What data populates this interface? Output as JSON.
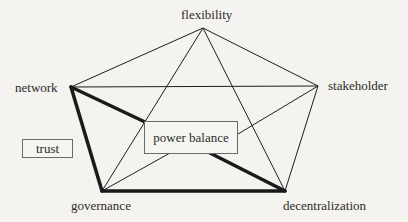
{
  "diagram": {
    "type": "pentagon-star-network",
    "nodes": [
      {
        "id": "flexibility",
        "label": "flexibility"
      },
      {
        "id": "network",
        "label": "network"
      },
      {
        "id": "stakeholder",
        "label": "stakeholder"
      },
      {
        "id": "governance",
        "label": "governance"
      },
      {
        "id": "decentralization",
        "label": "decentralization"
      }
    ],
    "center_box": {
      "label": "power balance"
    },
    "side_box": {
      "label": "trust"
    },
    "edges": {
      "thin": [
        [
          "flexibility",
          "network"
        ],
        [
          "flexibility",
          "stakeholder"
        ],
        [
          "flexibility",
          "governance"
        ],
        [
          "flexibility",
          "decentralization"
        ],
        [
          "network",
          "stakeholder"
        ],
        [
          "stakeholder",
          "decentralization"
        ],
        [
          "stakeholder",
          "governance"
        ]
      ],
      "thick": [
        [
          "network",
          "governance"
        ],
        [
          "governance",
          "decentralization"
        ],
        [
          "network",
          "power balance"
        ],
        [
          "power balance",
          "decentralization"
        ]
      ]
    },
    "colors": {
      "line": "#1e1e1e",
      "background": "#f4f3ef",
      "box_border": "#6a6a6a"
    }
  }
}
